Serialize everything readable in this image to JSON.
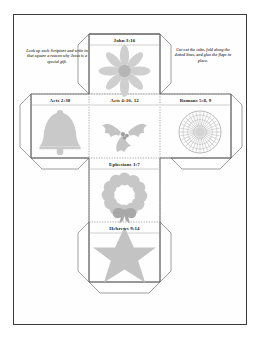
{
  "document": {
    "type": "printable-cube-craft-worksheet",
    "page_border_color": "#3b3b3b",
    "background_color": "#ffffff"
  },
  "instructions": {
    "left": "Look up each Scripture and write in that square a reason why Jesus is a special gift.",
    "right": "Cut out the cube, fold along the dotted lines, and glue the flaps in place."
  },
  "cube_net": {
    "fold_line_style": "dotted",
    "cut_line_style": "solid",
    "line_color": "#5a5a5a",
    "fold_color": "#8d8d8d",
    "art_fill": "#c9c9c9",
    "art_fill_dark": "#b0b0b0",
    "art_fill_light": "#dcdcdc",
    "panels": [
      {
        "id": "top",
        "label": "John 3:16",
        "art": "flower-icon"
      },
      {
        "id": "left",
        "label": "Acts 2:38",
        "art": "bell-icon"
      },
      {
        "id": "front",
        "label": "Acts 4:10, 12",
        "art": "holly-icon"
      },
      {
        "id": "right",
        "label": "Romans 5:8, 9",
        "art": "ornament-icon"
      },
      {
        "id": "bottom",
        "label": "Ephesians 1:7",
        "art": "wreath-icon"
      },
      {
        "id": "back",
        "label": "Hebrews 9:14",
        "art": "star-icon"
      }
    ]
  }
}
